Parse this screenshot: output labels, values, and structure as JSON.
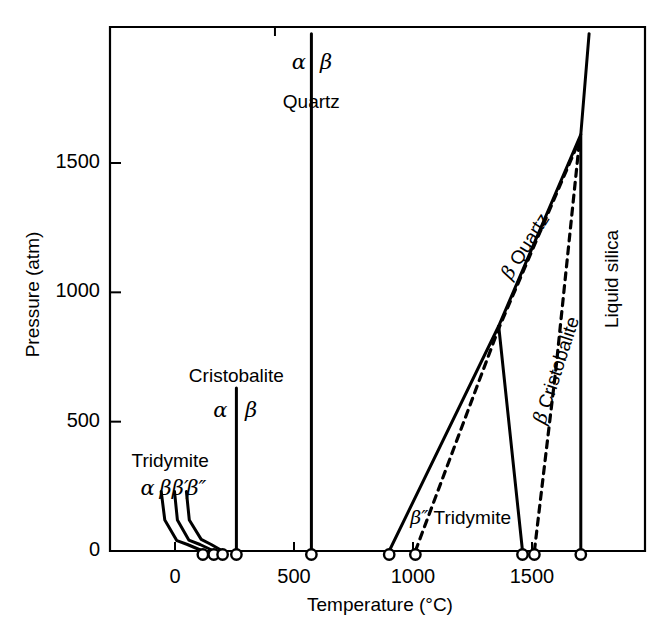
{
  "figure": {
    "kind": "phase-diagram",
    "background": "#ffffff",
    "line_color": "#000000"
  },
  "chart_data": {
    "type": "line",
    "title": "",
    "xlabel": "Temperature (°C)",
    "ylabel": "Pressure (atm)",
    "xlim": [
      -265,
      1975
    ],
    "ylim": [
      -20,
      2000
    ],
    "grid": false,
    "legend": "none",
    "x_ticks": [
      0,
      500,
      1000,
      1500
    ],
    "x_tick_labels": [
      "0",
      "500",
      "1000",
      "1500"
    ],
    "y_ticks": [
      0,
      500,
      1000,
      1500
    ],
    "y_tick_labels": [
      "0",
      "500",
      "1000",
      "1500"
    ],
    "axis_marker_points_c": [
      117,
      163,
      200,
      258,
      573,
      900,
      1010,
      1460,
      1510,
      1705
    ],
    "series": [
      {
        "name": "alpha-beta Tridymite boundary",
        "style": "solid",
        "points": [
          [
            -58,
            230
          ],
          [
            -43,
            120
          ],
          [
            8,
            40
          ],
          [
            52,
            25
          ],
          [
            117,
            0
          ]
        ]
      },
      {
        "name": "beta-beta-prime Tridymite boundary",
        "style": "solid",
        "points": [
          [
            -2,
            230
          ],
          [
            10,
            120
          ],
          [
            58,
            42
          ],
          [
            105,
            25
          ],
          [
            163,
            0
          ]
        ]
      },
      {
        "name": "beta-prime-beta-double-prime Tridymite boundary",
        "style": "solid",
        "points": [
          [
            48,
            230
          ],
          [
            60,
            120
          ],
          [
            110,
            45
          ],
          [
            152,
            25
          ],
          [
            200,
            0
          ]
        ]
      },
      {
        "name": "alpha-beta Cristobalite boundary",
        "style": "solid",
        "points": [
          [
            258,
            630
          ],
          [
            258,
            0
          ]
        ]
      },
      {
        "name": "alpha-beta Quartz boundary",
        "style": "solid",
        "points": [
          [
            573,
            2000
          ],
          [
            573,
            0
          ]
        ]
      },
      {
        "name": "beta Quartz liquidus",
        "style": "solid",
        "points": [
          [
            900,
            0
          ],
          [
            1360,
            870
          ],
          [
            1705,
            1610
          ]
        ]
      },
      {
        "name": "beta Quartz - beta Cristobalite boundary",
        "style": "solid",
        "points": [
          [
            1360,
            870
          ],
          [
            1460,
            0
          ]
        ]
      },
      {
        "name": "beta-double-prime Tridymite metastable boundary",
        "style": "dashed",
        "points": [
          [
            1010,
            0
          ],
          [
            1360,
            860
          ],
          [
            1700,
            1590
          ]
        ]
      },
      {
        "name": "beta Cristobalite metastable liquidus",
        "style": "dashed",
        "points": [
          [
            1510,
            0
          ],
          [
            1600,
            700
          ],
          [
            1700,
            1590
          ]
        ]
      },
      {
        "name": "Liquid silica boundary",
        "style": "solid",
        "points": [
          [
            1705,
            0
          ],
          [
            1705,
            1610
          ],
          [
            1740,
            2000
          ]
        ]
      }
    ],
    "annotations": [
      {
        "id": "quartz-alpha",
        "text": "α",
        "x_c": 520,
        "y_atm": 1890
      },
      {
        "id": "quartz-beta",
        "text": "β",
        "x_c": 635,
        "y_atm": 1890
      },
      {
        "id": "quartz-name",
        "text": "Quartz",
        "x_c": 573,
        "y_atm": 1740
      },
      {
        "id": "cristobalite-name",
        "text": "Cristobalite",
        "x_c": 258,
        "y_atm": 680
      },
      {
        "id": "cristobalite-alpha",
        "text": "α",
        "x_c": 190,
        "y_atm": 545
      },
      {
        "id": "cristobalite-beta",
        "text": "β",
        "x_c": 320,
        "y_atm": 545
      },
      {
        "id": "tridymite-name",
        "text": "Tridymite",
        "x_c": -20,
        "y_atm": 350
      },
      {
        "id": "tridymite-alpha",
        "text": "α",
        "x_c": -115,
        "y_atm": 245
      },
      {
        "id": "tridymite-beta",
        "text": "β",
        "x_c": -40,
        "y_atm": 245
      },
      {
        "id": "tridymite-beta-prime",
        "text": "β′",
        "x_c": 22,
        "y_atm": 245
      },
      {
        "id": "tridymite-beta-dprime",
        "text": "β″",
        "x_c": 90,
        "y_atm": 245
      },
      {
        "id": "beta-quartz-field",
        "text": "β Quartz",
        "x_c": 1470,
        "y_atm": 1180,
        "rotation": -58
      },
      {
        "id": "beta-cristobalite-field",
        "text": "β Cristobalite",
        "x_c": 1600,
        "y_atm": 700,
        "rotation": -72
      },
      {
        "id": "liquid-silica-field",
        "text": "Liquid silica",
        "x_c": 1830,
        "y_atm": 1050,
        "rotation": -90
      },
      {
        "id": "beta-dprime-tridymite-field",
        "text": "β″ Tridymite",
        "x_c": 1200,
        "y_atm": 130
      }
    ]
  }
}
